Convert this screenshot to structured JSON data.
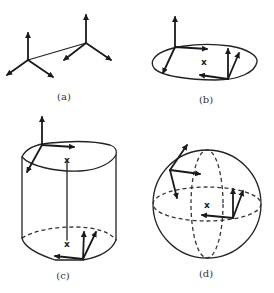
{
  "panels": [
    {
      "id": "a",
      "label": "(a)",
      "description": "Two moving frames connected by a line"
    },
    {
      "id": "b",
      "label": "(b)",
      "description": "Frames on a flat ellipse with center marked x"
    },
    {
      "id": "c",
      "label": "(c)",
      "description": "Cylinder with frames at top and bottom, axis between x marks"
    },
    {
      "id": "d",
      "label": "(d)",
      "description": "Sphere with great circles and two frames, center marked x"
    }
  ],
  "marks": {
    "center": "x"
  },
  "colors": {
    "ink": "#222222",
    "background": "#ffffff"
  }
}
